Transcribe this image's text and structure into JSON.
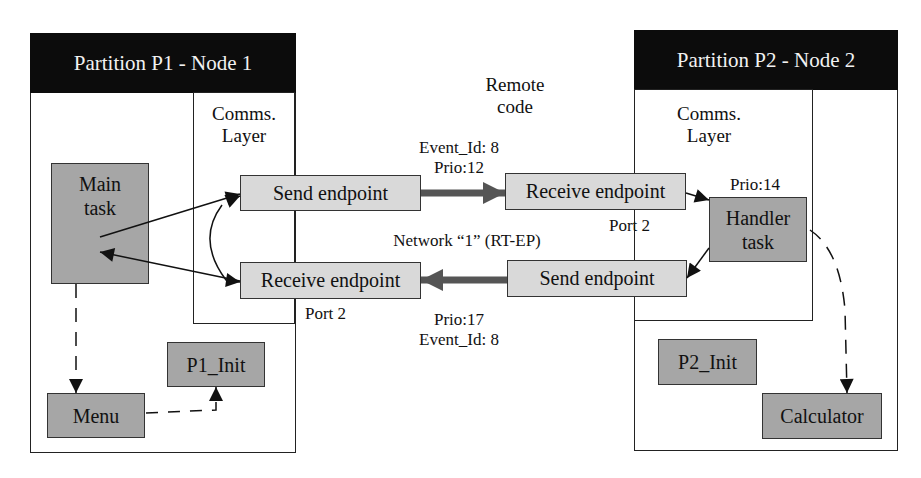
{
  "remote_code": {
    "line1": "Remote",
    "line2": "code"
  },
  "partition1": {
    "title": "Partition P1 - Node 1",
    "comms_layer": {
      "line1": "Comms.",
      "line2": "Layer"
    },
    "send_endpoint": "Send endpoint",
    "receive_endpoint": "Receive endpoint",
    "receive_port": "Port 2",
    "main_task": {
      "line1": "Main",
      "line2": "task"
    },
    "menu": "Menu",
    "init": "P1_Init"
  },
  "partition2": {
    "title": "Partition P2 - Node 2",
    "comms_layer": {
      "line1": "Comms.",
      "line2": "Layer"
    },
    "receive_endpoint": "Receive endpoint",
    "receive_port": "Port 2",
    "send_endpoint": "Send endpoint",
    "handler_task": {
      "line1": "Handler",
      "line2": "task",
      "prio": "Prio:14"
    },
    "init": "P2_Init",
    "calculator": "Calculator"
  },
  "network": {
    "label": "Network “1” (RT-EP)",
    "forward_message": {
      "event_id": "Event_Id: 8",
      "prio": "Prio:12"
    },
    "reply_message": {
      "prio": "Prio:17",
      "event_id": "Event_Id: 8"
    }
  },
  "colors": {
    "header_bg": "#0c0c0c",
    "endpoint_fill": "#d9d9d9",
    "task_fill": "#a6a6a6",
    "network_arrow": "#555555"
  }
}
